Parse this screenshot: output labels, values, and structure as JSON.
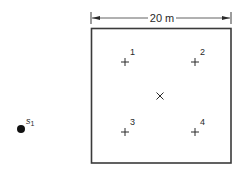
{
  "diagram": {
    "dimension": {
      "label": "20 m"
    },
    "source": {
      "label": "s",
      "subscript": "1"
    },
    "center_marker": {
      "symbol": "×"
    },
    "receivers": [
      {
        "id": "1",
        "label": "1"
      },
      {
        "id": "2",
        "label": "2"
      },
      {
        "id": "3",
        "label": "3"
      },
      {
        "id": "4",
        "label": "4"
      }
    ],
    "colors": {
      "line": "#3a3a3a",
      "text": "#2a2a2a"
    }
  }
}
